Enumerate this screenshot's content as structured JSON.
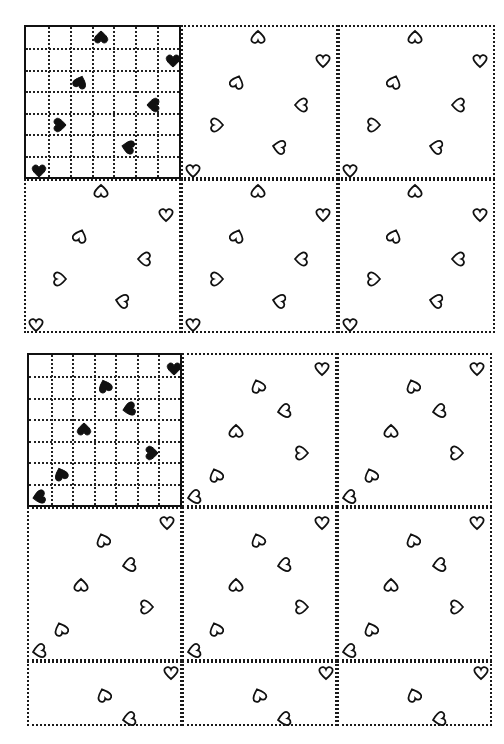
{
  "page": {
    "colors": {
      "ink": "#111111",
      "paper": "#ffffff"
    }
  },
  "puzzles": [
    {
      "id": "puzzle-1",
      "origin": [
        24,
        25
      ],
      "panel_size": [
        157,
        154
      ],
      "grid_size": 7,
      "rows": 2,
      "cols": 3,
      "key_hearts": [
        {
          "x": 75,
          "y": 10,
          "rot": 180
        },
        {
          "x": 147,
          "y": 34,
          "rot": 0
        },
        {
          "x": 54,
          "y": 55,
          "rot": 200
        },
        {
          "x": 127,
          "y": 78,
          "rot": 90
        },
        {
          "x": 34,
          "y": 98,
          "rot": 270
        },
        {
          "x": 102,
          "y": 120,
          "rot": 100
        },
        {
          "x": 13,
          "y": 144,
          "rot": 0
        }
      ],
      "outline_hearts": [
        {
          "x": 75,
          "y": 10,
          "rot": 180
        },
        {
          "x": 140,
          "y": 34,
          "rot": 0
        },
        {
          "x": 54,
          "y": 55,
          "rot": 200
        },
        {
          "x": 118,
          "y": 78,
          "rot": 90
        },
        {
          "x": 34,
          "y": 98,
          "rot": 270
        },
        {
          "x": 96,
          "y": 120,
          "rot": 100
        },
        {
          "x": 10,
          "y": 144,
          "rot": 0
        }
      ]
    },
    {
      "id": "puzzle-2",
      "origin": [
        27,
        353
      ],
      "panel_size": [
        155,
        154
      ],
      "grid_size": 7,
      "rows": 2,
      "cols": 3,
      "partial_row": {
        "height": 65,
        "hearts": [
          {
            "x": 142,
            "y": 10,
            "rot": 0
          },
          {
            "x": 75,
            "y": 32,
            "rot": 160
          },
          {
            "x": 100,
            "y": 56,
            "rot": 80
          }
        ]
      },
      "key_hearts": [
        {
          "x": 145,
          "y": 14,
          "rot": 0
        },
        {
          "x": 76,
          "y": 31,
          "rot": 160
        },
        {
          "x": 100,
          "y": 54,
          "rot": 80
        },
        {
          "x": 55,
          "y": 74,
          "rot": 180
        },
        {
          "x": 123,
          "y": 98,
          "rot": 270
        },
        {
          "x": 32,
          "y": 119,
          "rot": 160
        },
        {
          "x": 10,
          "y": 142,
          "rot": 80
        }
      ],
      "outline_hearts": [
        {
          "x": 138,
          "y": 14,
          "rot": 0
        },
        {
          "x": 74,
          "y": 31,
          "rot": 160
        },
        {
          "x": 100,
          "y": 56,
          "rot": 80
        },
        {
          "x": 52,
          "y": 76,
          "rot": 180
        },
        {
          "x": 118,
          "y": 98,
          "rot": 270
        },
        {
          "x": 32,
          "y": 120,
          "rot": 160
        },
        {
          "x": 10,
          "y": 142,
          "rot": 80
        }
      ]
    }
  ],
  "caption": ""
}
